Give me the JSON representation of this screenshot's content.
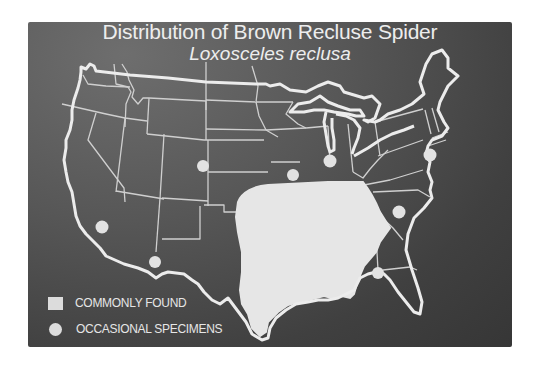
{
  "map": {
    "title": "Distribution of Brown Recluse Spider",
    "subtitle": "Loxosceles reclusa",
    "region": "Contiguous United States",
    "colors": {
      "background": "#4a4a4a",
      "outline": "#e8e8e8",
      "state_lines": "#cfcfcf",
      "commonly_found_fill": "#e6e6e6",
      "occasional_marker": "#e2e2e2"
    },
    "legend": [
      {
        "symbol": "square",
        "label": "COMMONLY FOUND"
      },
      {
        "symbol": "circle",
        "label": "OCCASIONAL SPECIMENS"
      }
    ],
    "occasional_specimens": [
      {
        "approx_location": "Southern California"
      },
      {
        "approx_location": "Southern Arizona"
      },
      {
        "approx_location": "Wyoming"
      },
      {
        "approx_location": "Iowa"
      },
      {
        "approx_location": "Chicago, Illinois"
      },
      {
        "approx_location": "New Jersey / New York"
      },
      {
        "approx_location": "North Carolina"
      },
      {
        "approx_location": "Northern Florida"
      }
    ],
    "commonly_found_area": "South-central and southeastern United States (from Texas/Oklahoma east through Georgia, north to Missouri, Illinois, Kentucky, Tennessee)"
  }
}
